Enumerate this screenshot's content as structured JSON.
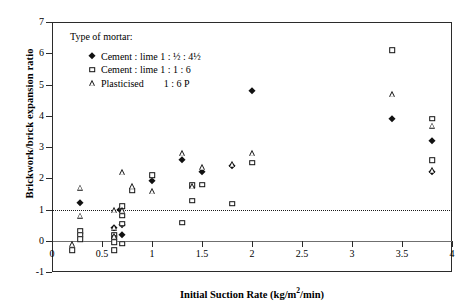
{
  "chart_data": {
    "type": "scatter",
    "title": "",
    "xlabel": "Initial Suction Rate (kg/m²/min)",
    "ylabel": "Brickwork/brick expansion ratio",
    "xlim": [
      0,
      4
    ],
    "ylim": [
      -1,
      7
    ],
    "xticks": [
      "0",
      "0.5",
      "1",
      "1.5",
      "2",
      "2.5",
      "3",
      "3.5",
      "4"
    ],
    "yticks": [
      "-1",
      "0",
      "1",
      "2",
      "3",
      "4",
      "5",
      "6",
      "7"
    ],
    "grid": false,
    "legend_position": "top-left",
    "reference_lines": [
      {
        "axis": "y",
        "value": 1,
        "style": "dotted"
      },
      {
        "axis": "y",
        "value": 0,
        "style": "solid"
      }
    ],
    "legend_title": "Type of mortar:",
    "series": [
      {
        "name": "Cement : lime 1 : ½ : 4½",
        "marker": "filled-diamond",
        "points": [
          [
            0.28,
            1.2
          ],
          [
            0.62,
            0.4
          ],
          [
            0.68,
            1.0
          ],
          [
            0.7,
            0.5
          ],
          [
            0.7,
            0.2
          ],
          [
            1.0,
            1.9
          ],
          [
            1.3,
            2.6
          ],
          [
            1.5,
            2.2
          ],
          [
            1.8,
            2.4
          ],
          [
            2.0,
            4.8
          ],
          [
            3.4,
            3.9
          ],
          [
            3.8,
            3.2
          ],
          [
            3.8,
            2.2
          ]
        ]
      },
      {
        "name": "Cement : lime 1 : 1 : 6",
        "marker": "open-square",
        "points": [
          [
            0.2,
            -0.3
          ],
          [
            0.28,
            0.3
          ],
          [
            0.28,
            0.2
          ],
          [
            0.28,
            0.05
          ],
          [
            0.62,
            0.2
          ],
          [
            0.62,
            0.1
          ],
          [
            0.62,
            -0.05
          ],
          [
            0.62,
            -0.3
          ],
          [
            0.7,
            1.1
          ],
          [
            0.7,
            0.8
          ],
          [
            0.7,
            0.55
          ],
          [
            0.7,
            -0.1
          ],
          [
            0.8,
            1.6
          ],
          [
            1.0,
            2.1
          ],
          [
            1.3,
            0.58
          ],
          [
            1.4,
            1.78
          ],
          [
            1.4,
            1.28
          ],
          [
            1.5,
            1.8
          ],
          [
            1.8,
            1.18
          ],
          [
            2.0,
            2.5
          ],
          [
            3.4,
            6.1
          ],
          [
            3.8,
            3.9
          ],
          [
            3.8,
            2.58
          ]
        ]
      },
      {
        "name": "Plasticised        1 : 6 P",
        "marker": "open-triangle",
        "points": [
          [
            0.2,
            -0.1
          ],
          [
            0.28,
            1.7
          ],
          [
            0.28,
            0.8
          ],
          [
            0.62,
            0.98
          ],
          [
            0.62,
            0.42
          ],
          [
            0.62,
            0.15
          ],
          [
            0.7,
            2.2
          ],
          [
            0.7,
            0.98
          ],
          [
            0.8,
            1.75
          ],
          [
            1.0,
            1.58
          ],
          [
            1.3,
            2.8
          ],
          [
            1.4,
            1.75
          ],
          [
            1.5,
            2.35
          ],
          [
            1.8,
            2.45
          ],
          [
            2.0,
            2.8
          ],
          [
            3.4,
            4.7
          ],
          [
            3.8,
            3.68
          ],
          [
            3.8,
            2.25
          ]
        ]
      }
    ]
  },
  "legend": {
    "title": "Type of mortar:",
    "entries": [
      {
        "symbol": "filled-diamond",
        "label": "Cement : lime 1 : ½ : 4½"
      },
      {
        "symbol": "open-square",
        "label": "Cement : lime 1 : 1 : 6"
      },
      {
        "symbol": "open-triangle",
        "label": "Plasticised",
        "label2": "1 : 6 P"
      }
    ]
  },
  "axes": {
    "x_title": "Initial Suction Rate (kg/m",
    "x_title_sup": "2",
    "x_title_tail": "/min)",
    "y_title": "Brickwork/brick expansion ratio"
  }
}
